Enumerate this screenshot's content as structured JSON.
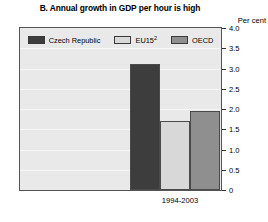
{
  "figure": {
    "title": "B. Annual growth in GDP per hour is high",
    "unit_label": "Per cent"
  },
  "legend": {
    "items": [
      {
        "label": "Czech Republic",
        "color": "#3d3d3d"
      },
      {
        "label": "EU15",
        "superscript": "2",
        "color": "#d8d8d8"
      },
      {
        "label": "OECD",
        "color": "#8f8f8f"
      }
    ]
  },
  "axis": {
    "y_ticks": [
      "4.0",
      "3.5",
      "3.0",
      "2.5",
      "2.0",
      "1.5",
      "1.0",
      "0.5",
      "0"
    ],
    "x_label": "1994-2003"
  },
  "chart_data": {
    "type": "bar",
    "title": "B. Annual growth in GDP per hour is high",
    "xlabel": "1994-2003",
    "ylabel": "Per cent",
    "ylim": [
      0,
      4.0
    ],
    "ytick_values": [
      4.0,
      3.5,
      3.0,
      2.5,
      2.0,
      1.5,
      1.0,
      0.5,
      0
    ],
    "grid": true,
    "legend_position": "top-inside",
    "categories": [
      "1994-2003"
    ],
    "series": [
      {
        "name": "Czech Republic",
        "values": [
          3.1
        ],
        "color": "#3d3d3d"
      },
      {
        "name": "EU15",
        "values": [
          1.7
        ],
        "color": "#d8d8d8"
      },
      {
        "name": "OECD",
        "values": [
          1.95
        ],
        "color": "#8f8f8f"
      }
    ]
  }
}
